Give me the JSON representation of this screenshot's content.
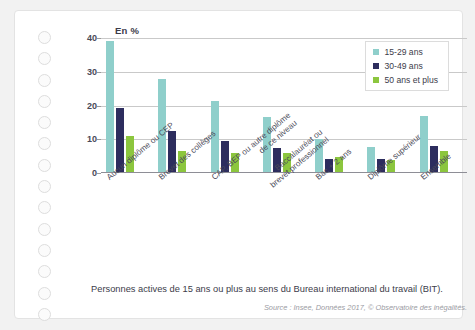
{
  "chart_data": {
    "type": "bar",
    "title": "",
    "axis_unit_label": "En %",
    "xlabel": "",
    "ylabel": "En %",
    "ylim": [
      0,
      40
    ],
    "yticks": [
      0,
      10,
      20,
      30,
      40
    ],
    "grid": true,
    "legend_position": "top-right",
    "categories": [
      "Aucun diplôme ou CEP",
      "Brevet des collèges",
      "CAP, BEP ou autre diplôme de ce niveau",
      "Baccalauréat ou brevet professionnel",
      "Bac + 2 ans",
      "Diplôme supérieur",
      "Ensemble"
    ],
    "categories_lines": [
      [
        "Aucun diplôme ou CEP"
      ],
      [
        "Brevet des collèges"
      ],
      [
        "CAP, BEP ou autre diplôme",
        "de ce niveau"
      ],
      [
        "Baccalauréat ou",
        "brevet professionnel"
      ],
      [
        "Bac + 2 ans"
      ],
      [
        "Diplôme supérieur"
      ],
      [
        "Ensemble"
      ]
    ],
    "series": [
      {
        "name": "15-29 ans",
        "color": "#8fcfcb",
        "values": [
          39.0,
          27.8,
          21.2,
          16.5,
          10.1,
          7.7,
          16.9
        ]
      },
      {
        "name": "30-49 ans",
        "color": "#2d2d5e",
        "values": [
          19.3,
          12.4,
          9.4,
          7.4,
          4.2,
          4.2,
          8.0
        ]
      },
      {
        "name": "50 ans et plus",
        "color": "#8cc63e",
        "values": [
          11.0,
          6.4,
          5.9,
          6.0,
          4.7,
          3.8,
          6.4
        ]
      }
    ]
  },
  "footer": {
    "note": "Personnes actives de 15 ans ou plus au sens du Bureau international du travail (BIT).",
    "source": "Source : Insee, Données 2017, © Observatoire des inégalités."
  },
  "decor": {
    "punch_hole_count": 14,
    "page_background": "#f2f2f2",
    "sheet_background": "#ffffff"
  }
}
